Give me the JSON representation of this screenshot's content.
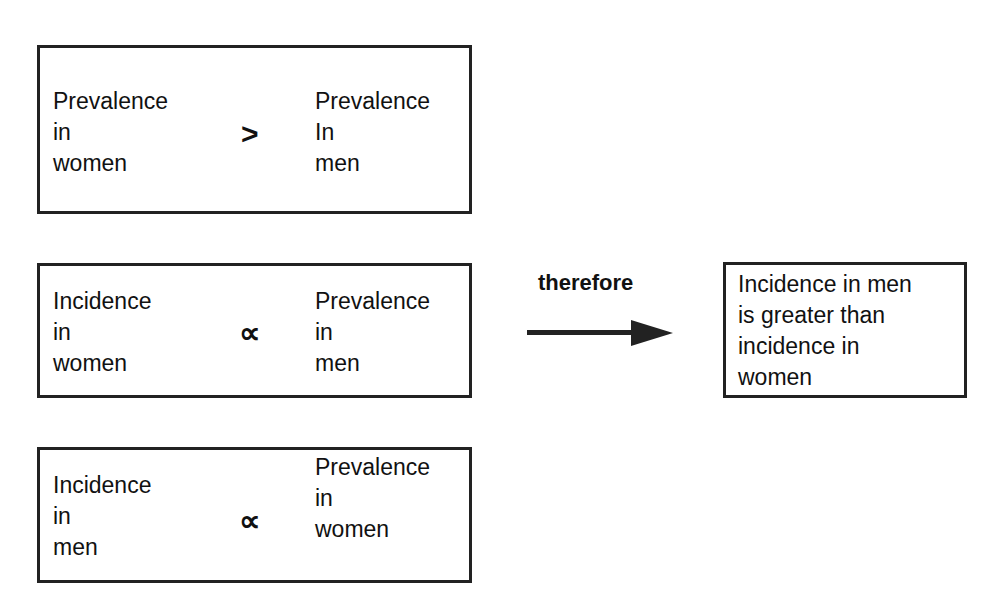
{
  "rows": [
    {
      "left": [
        "Prevalence",
        "in",
        "women"
      ],
      "operator": ">",
      "right": [
        "Prevalence",
        "In",
        "men"
      ]
    },
    {
      "left": [
        "Incidence",
        "in",
        "women"
      ],
      "operator": "∝",
      "right": [
        "Prevalence",
        "in",
        "men"
      ]
    },
    {
      "left": [
        "Incidence",
        "in",
        "men"
      ],
      "operator": "∝",
      "right": [
        "Prevalence",
        "in",
        "women"
      ]
    }
  ],
  "connector": {
    "label": "therefore",
    "icon": "arrow-right-icon"
  },
  "conclusion": [
    "Incidence in men",
    "is greater than",
    "incidence in",
    "women"
  ]
}
